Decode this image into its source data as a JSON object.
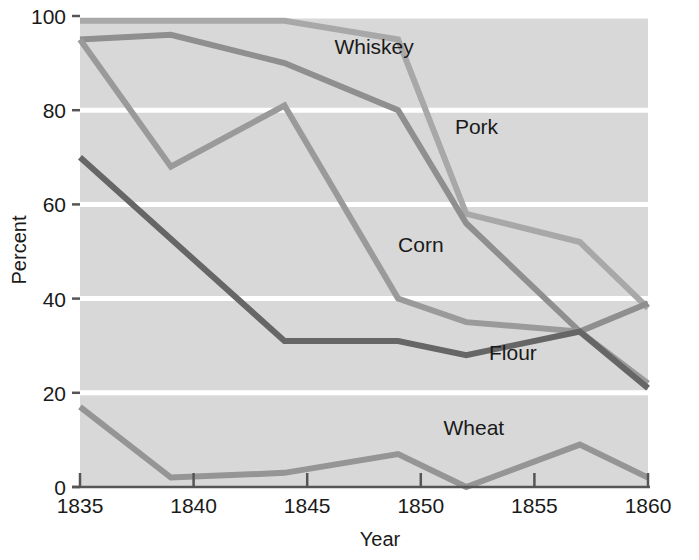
{
  "chart_data": {
    "type": "line",
    "title": "",
    "xlabel": "Year",
    "ylabel": "Percent",
    "xlim": [
      1835,
      1860
    ],
    "ylim": [
      0,
      100
    ],
    "x_ticks": [
      1835,
      1840,
      1845,
      1850,
      1855,
      1860
    ],
    "x_tick_labels": [
      "1835",
      "1840",
      "1845",
      "1850",
      "1855",
      "1860"
    ],
    "y_ticks": [
      0,
      20,
      40,
      60,
      80,
      100
    ],
    "y_tick_labels": [
      "0",
      "20",
      "40",
      "60",
      "80",
      "100"
    ],
    "grid": "horizontal-white",
    "legend": "inline-labels",
    "series": [
      {
        "name": "Whiskey",
        "color": "#a8a8a8",
        "label_x": 1846.2,
        "label_y": 92,
        "x": [
          1835,
          1840,
          1844,
          1849,
          1852,
          1857,
          1860
        ],
        "values": [
          99,
          99,
          99,
          95,
          58,
          52,
          38
        ]
      },
      {
        "name": "Pork",
        "color": "#8f8f8f",
        "label_x": 1851.5,
        "label_y": 75,
        "x": [
          1835,
          1839,
          1844,
          1849,
          1852,
          1857,
          1860
        ],
        "values": [
          95,
          96,
          90,
          80,
          56,
          33,
          39
        ]
      },
      {
        "name": "Corn",
        "color": "#9a9a9a",
        "label_x": 1849.0,
        "label_y": 50,
        "x": [
          1835,
          1839,
          1844,
          1849,
          1852,
          1857,
          1860
        ],
        "values": [
          95,
          68,
          81,
          40,
          35,
          33,
          22
        ]
      },
      {
        "name": "Flour",
        "color": "#666666",
        "label_x": 1853.0,
        "label_y": 27,
        "x": [
          1835,
          1844,
          1849,
          1852,
          1857,
          1860
        ],
        "values": [
          70,
          31,
          31,
          28,
          33,
          21
        ]
      },
      {
        "name": "Wheat",
        "color": "#959595",
        "label_x": 1851.0,
        "label_y": 11,
        "x": [
          1835,
          1839,
          1844,
          1849,
          1852,
          1857,
          1860
        ],
        "values": [
          17,
          2,
          3,
          7,
          0,
          9,
          2
        ]
      }
    ]
  },
  "colors": {
    "plot_background": "#d8d8d8",
    "gridline": "#ffffff",
    "axis": "#555555",
    "text": "#1a1a1a",
    "page_background": "#ffffff"
  }
}
